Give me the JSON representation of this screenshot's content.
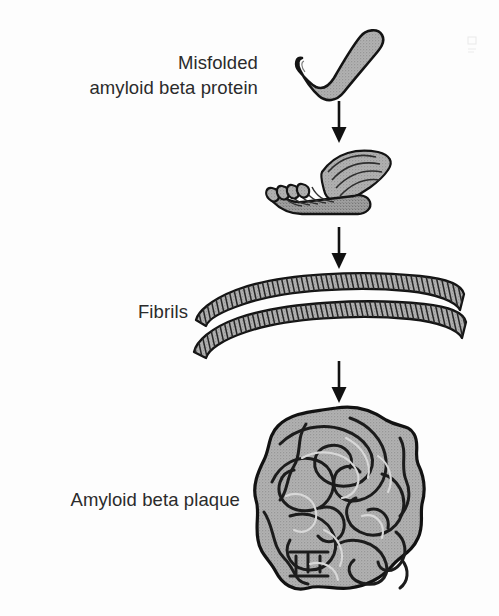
{
  "diagram": {
    "background_color": "#fdfdfd",
    "structure_fill": "#a8a8a8",
    "structure_outline": "#161616",
    "text_color": "#2b2b2b",
    "labels": {
      "misfolded": "Misfolded\namyloid beta protein",
      "fibrils": "Fibrils",
      "plaque": "Amyloid beta plaque"
    },
    "stages": [
      {
        "id": "monomer",
        "label": "Misfolded amyloid beta protein",
        "icon": "misfolded-protein-icon",
        "description": "Single hook-shaped misfolded peptide chain"
      },
      {
        "id": "beta-sheet",
        "label": "Beta sheet oligomer",
        "icon": "beta-sheet-icon",
        "description": "Stacked pleated sheet of six aligned strands"
      },
      {
        "id": "fibrils",
        "label": "Fibrils",
        "icon": "fibril-icon",
        "description": "Two long curved striated ribbon fibrils"
      },
      {
        "id": "plaque",
        "label": "Amyloid beta plaque",
        "icon": "plaque-icon",
        "description": "Dense tangled aggregate mass of fibrils"
      }
    ],
    "arrows": [
      {
        "id": "arrow-1",
        "icon": "down-arrow-icon",
        "from": "monomer",
        "to": "beta-sheet"
      },
      {
        "id": "arrow-2",
        "icon": "down-arrow-icon",
        "from": "beta-sheet",
        "to": "fibrils"
      },
      {
        "id": "arrow-3",
        "icon": "down-arrow-icon",
        "from": "fibrils",
        "to": "plaque"
      }
    ]
  }
}
